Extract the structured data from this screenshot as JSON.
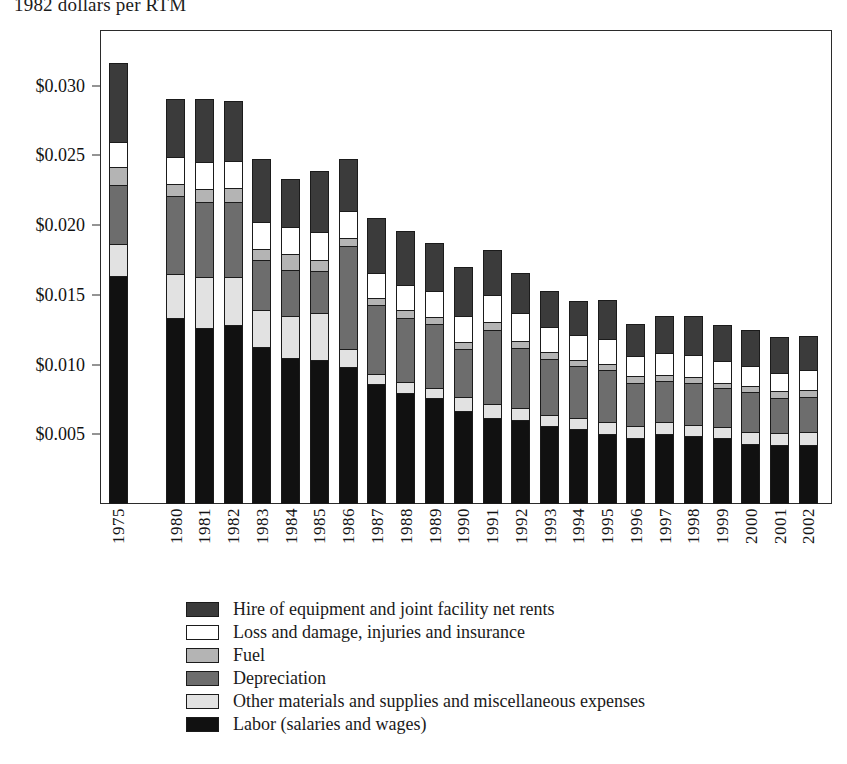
{
  "chart_data": {
    "type": "bar",
    "subtype": "stacked-bar",
    "title": "1982 dollars per RTM",
    "xlabel": "",
    "ylabel": "",
    "ylim": [
      0,
      0.034
    ],
    "ytick_values": [
      0.005,
      0.01,
      0.015,
      0.02,
      0.025,
      0.03
    ],
    "ytick_labels": [
      "$0.005",
      "$0.010",
      "$0.015",
      "$0.020",
      "$0.025",
      "$0.030"
    ],
    "grid": false,
    "legend_position": "bottom",
    "categories": [
      "1975",
      "1980",
      "1981",
      "1982",
      "1983",
      "1984",
      "1985",
      "1986",
      "1987",
      "1988",
      "1989",
      "1990",
      "1991",
      "1992",
      "1993",
      "1994",
      "1995",
      "1996",
      "1997",
      "1998",
      "1999",
      "2000",
      "2001",
      "2002"
    ],
    "gap_after": [
      "1975"
    ],
    "stack_order_bottom_to_top": [
      "Labor (salaries and wages)",
      "Other materials and supplies and miscellaneous expenses",
      "Depreciation",
      "Fuel",
      "Loss and damage, injuries and insurance",
      "Hire of equipment and joint facility net rents"
    ],
    "series": [
      {
        "name": "Labor (salaries and wages)",
        "color": "#111111",
        "values": [
          0.01635,
          0.01337,
          0.01262,
          0.01285,
          0.01128,
          0.0105,
          0.01036,
          0.00981,
          0.0086,
          0.00794,
          0.0076,
          0.00665,
          0.0062,
          0.006,
          0.0056,
          0.0054,
          0.005,
          0.0047,
          0.005,
          0.00485,
          0.0047,
          0.0043,
          0.00425,
          0.00425
        ]
      },
      {
        "name": "Other materials and supplies and miscellaneous expenses",
        "color": "#e2e2e2",
        "values": [
          0.0023,
          0.0031,
          0.00365,
          0.0034,
          0.00263,
          0.003,
          0.00332,
          0.0013,
          0.00075,
          0.0008,
          0.00075,
          0.001,
          0.00095,
          0.0009,
          0.0008,
          0.0008,
          0.0009,
          0.0009,
          0.0009,
          0.0008,
          0.00085,
          0.0009,
          0.00085,
          0.00088
        ]
      },
      {
        "name": "Depreciation",
        "color": "#6d6d6d",
        "values": [
          0.00425,
          0.0056,
          0.0054,
          0.00545,
          0.0036,
          0.0033,
          0.003,
          0.0074,
          0.00495,
          0.0046,
          0.00455,
          0.0035,
          0.0053,
          0.0043,
          0.004,
          0.0037,
          0.0037,
          0.0031,
          0.0029,
          0.00305,
          0.00275,
          0.0028,
          0.0025,
          0.00255
        ]
      },
      {
        "name": "Fuel",
        "color": "#b4b4b4",
        "values": [
          0.00125,
          0.0009,
          0.00095,
          0.001,
          0.00075,
          0.0011,
          0.00085,
          0.00055,
          0.00045,
          0.00055,
          0.00055,
          0.0005,
          0.0006,
          0.0005,
          0.0005,
          0.00045,
          0.00045,
          0.00045,
          0.00045,
          0.0004,
          0.0004,
          0.00045,
          0.0005,
          0.0005
        ]
      },
      {
        "name": "Loss and damage, injuries and insurance",
        "color": "#ffffff",
        "values": [
          0.00185,
          0.00195,
          0.00195,
          0.0019,
          0.00195,
          0.00195,
          0.00195,
          0.00195,
          0.0018,
          0.00185,
          0.00185,
          0.00185,
          0.00195,
          0.002,
          0.0018,
          0.00175,
          0.0018,
          0.0015,
          0.0016,
          0.0016,
          0.00155,
          0.00145,
          0.0013,
          0.0014
        ]
      },
      {
        "name": "Hire of equipment and joint facility net rents",
        "color": "#3b3b3b",
        "values": [
          0.00565,
          0.0041,
          0.00445,
          0.0043,
          0.00455,
          0.00345,
          0.0044,
          0.00375,
          0.004,
          0.00385,
          0.0034,
          0.0035,
          0.0032,
          0.0029,
          0.00255,
          0.0025,
          0.0028,
          0.00225,
          0.00265,
          0.0028,
          0.0026,
          0.0026,
          0.00255,
          0.00245
        ]
      }
    ],
    "totals": [
      0.03165,
      0.02902,
      0.02902,
      0.0289,
      0.02476,
      0.0233,
      0.02388,
      0.02476,
      0.02055,
      0.01959,
      0.0187,
      0.017,
      0.0192,
      0.0166,
      0.01525,
      0.0146,
      0.01465,
      0.0129,
      0.0135,
      0.0135,
      0.01285,
      0.0125,
      0.01195,
      0.01203
    ]
  },
  "legend": {
    "items": [
      {
        "label": "Hire of equipment and joint facility net rents",
        "color": "#3b3b3b"
      },
      {
        "label": "Loss and damage, injuries and insurance",
        "color": "#ffffff"
      },
      {
        "label": "Fuel",
        "color": "#b4b4b4"
      },
      {
        "label": "Depreciation",
        "color": "#6d6d6d"
      },
      {
        "label": "Other materials and supplies and miscellaneous expenses",
        "color": "#e2e2e2"
      },
      {
        "label": "Labor (salaries and wages)",
        "color": "#111111"
      }
    ]
  }
}
